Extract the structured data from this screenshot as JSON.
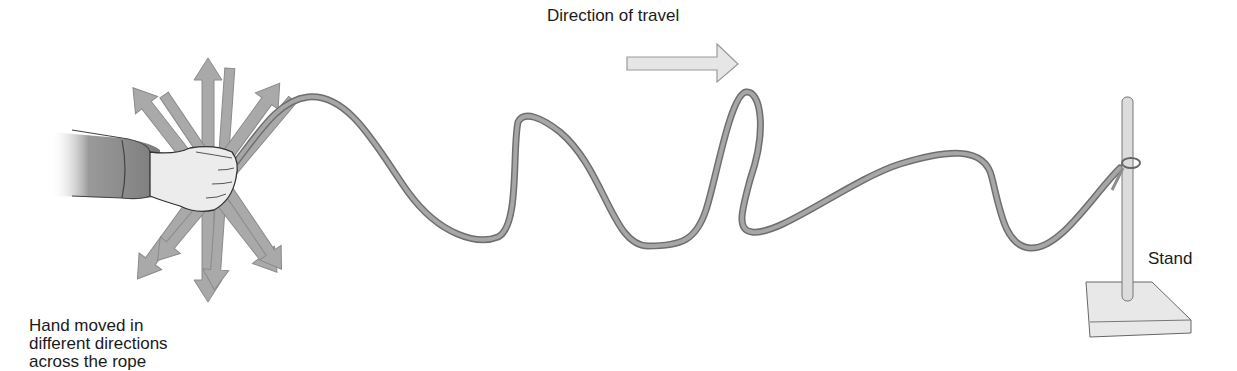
{
  "diagram": {
    "labels": {
      "direction_of_travel": "Direction of travel",
      "stand": "Stand",
      "hand_line1": "Hand moved in",
      "hand_line2": "different directions",
      "hand_line3": "across the rope"
    },
    "components": [
      "hand",
      "rope",
      "stand",
      "direction-arrow",
      "motion-arrows"
    ],
    "colors": {
      "rope": "#8c8c8c",
      "rope_outline": "#6e6e6e",
      "arrow_fill": "#a9a9a9",
      "arrow_light_fill": "#e6e6e6",
      "sleeve": "#7a7a7a",
      "hand": "#ececec",
      "stand_rod": "#dcdcdc",
      "stand_base": "#e8e8e8",
      "text": "#1a1a1a"
    }
  }
}
